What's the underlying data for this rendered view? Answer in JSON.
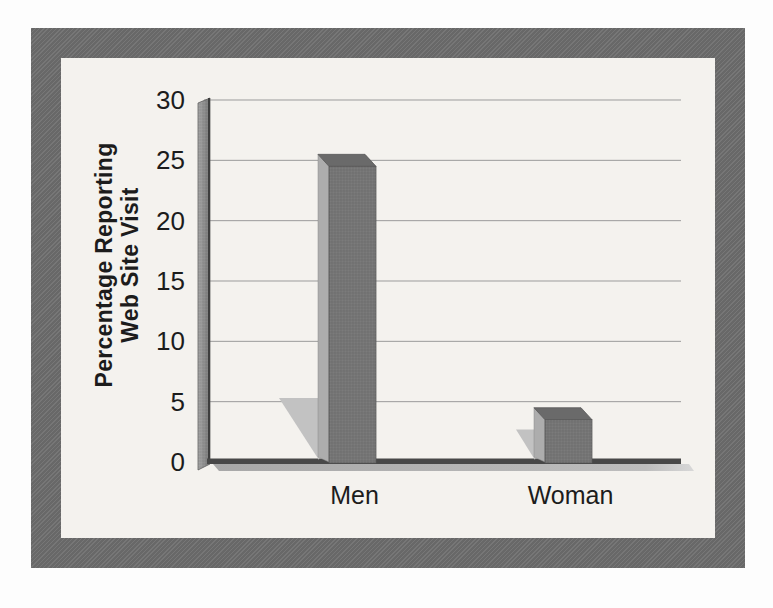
{
  "figure": {
    "page_color": "#fdfdfd",
    "frame_color": "#6e6e6e",
    "panel_color": "#f4f2ee"
  },
  "chart_data": {
    "type": "bar",
    "style": "3d-halftone-scan",
    "title": "",
    "xlabel": "",
    "ylabel_lines": [
      "Percentage Reporting",
      "Web Site Visit"
    ],
    "categories": [
      "Men",
      "Woman"
    ],
    "values": [
      25,
      4
    ],
    "ylim": [
      0,
      30
    ],
    "yticks": [
      0,
      5,
      10,
      15,
      20,
      25,
      30
    ],
    "grid": "horizontal",
    "legend": "none",
    "colors": {
      "bar_front": "#767676",
      "bar_top": "#6a6a6a",
      "bar_side": "#adadad",
      "bar_ground_shadow": "#c2c2c2",
      "wall_light": "#a6a6a6",
      "wall_dark": "#777777",
      "axis_edge": "#3e3e3e",
      "gridline": "#9b9b9b",
      "baseline": "#484848",
      "baseline_shadow": "#b3b3b3",
      "text": "#1c1c1c"
    }
  }
}
